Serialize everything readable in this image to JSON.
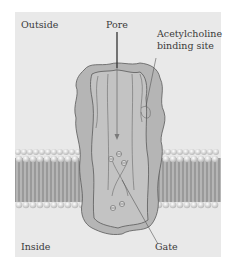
{
  "diagram": {
    "labels": {
      "outside": "Outside",
      "inside": "Inside",
      "pore": "Pore",
      "binding_site_line1": "Acetylcholine",
      "binding_site_line2": "binding site",
      "gate": "Gate"
    },
    "colors": {
      "background": "#e9e9e9",
      "protein_fill": "#b9b9b9",
      "protein_stroke": "#5a5a5a",
      "membrane_tails": "#8f8f8f",
      "lipid_heads": "#f4f4f4",
      "pore_arrow": "#333333"
    }
  }
}
